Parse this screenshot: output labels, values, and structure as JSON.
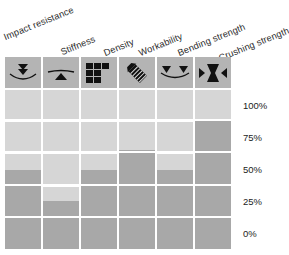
{
  "chart_data": {
    "type": "bar",
    "title": "",
    "subtitle": "",
    "xlabel": "",
    "ylabel": "",
    "ylim": [
      0,
      100
    ],
    "grid": true,
    "legend_position": "none",
    "orientation": "vertical",
    "categories": [
      "Impact resistance",
      "Stiffness",
      "Density",
      "Workability",
      "Bending strength",
      "Crushing strength"
    ],
    "tick_labels": [
      "100%",
      "75%",
      "50%",
      "25%",
      "0%"
    ],
    "tick_values": [
      100,
      75,
      50,
      25,
      0
    ],
    "values": [
      50,
      25,
      50,
      65,
      50,
      90
    ],
    "series": [
      {
        "name": "Rating",
        "values": [
          50,
          25,
          50,
          65,
          50,
          90
        ]
      }
    ],
    "colors": {
      "bar_fill": "#a8a8a8",
      "cell_background": "#d6d6d6",
      "icon_background": "#b4b4b4",
      "gridline": "#ffffff",
      "text": "#1c1c1c",
      "page_background": "#ffffff"
    }
  },
  "header": {
    "labels": [
      {
        "text": "Impact resistance",
        "icon": "double-chevron-down-on-curve-icon"
      },
      {
        "text": "Stiffness",
        "icon": "beam-on-fulcrum-icon"
      },
      {
        "text": "Density",
        "icon": "brick-grid-icon"
      },
      {
        "text": "Workability",
        "icon": "diagonal-file-tool-icon"
      },
      {
        "text": "Bending strength",
        "icon": "two-loads-on-sagging-beam-icon"
      },
      {
        "text": "Crushing strength",
        "icon": "hourglass-compression-arrows-icon"
      }
    ]
  },
  "axis": {
    "ticks": [
      {
        "label": "100%",
        "value": 100
      },
      {
        "label": "75%",
        "value": 75
      },
      {
        "label": "50%",
        "value": 50
      },
      {
        "label": "25%",
        "value": 25
      },
      {
        "label": "0%",
        "value": 0
      }
    ]
  }
}
